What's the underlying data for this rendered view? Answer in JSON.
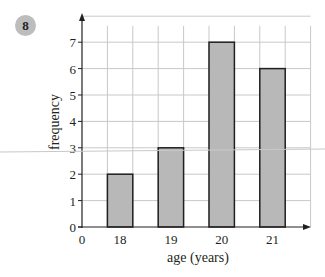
{
  "question_number": "8",
  "chart_data": {
    "type": "bar",
    "title": "",
    "xlabel": "age (years)",
    "ylabel": "frequency",
    "categories": [
      "18",
      "19",
      "20",
      "21"
    ],
    "values": [
      2,
      3,
      7,
      6
    ],
    "x_origin_label": "0",
    "yticks": [
      "0",
      "1",
      "2",
      "3",
      "4",
      "5",
      "6",
      "7"
    ],
    "ylim": [
      0,
      8
    ],
    "grid": true,
    "legend": null
  },
  "colors": {
    "bar_fill": "#b8b8b8",
    "bar_stroke": "#231f20",
    "grid": "#c8c8c8",
    "axis": "#231f20",
    "badge": "#bdbdbd"
  }
}
